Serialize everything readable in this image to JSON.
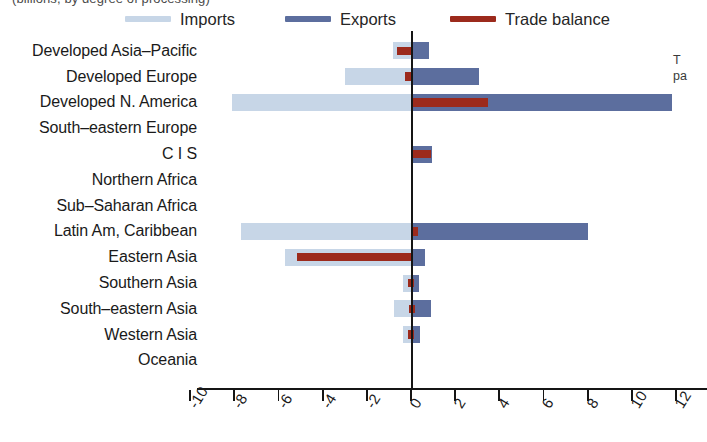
{
  "title_clipped": "(billions, by degree of processing)",
  "side_note_clipped": "T\npa",
  "legend": {
    "items": [
      {
        "label": "Imports",
        "color": "#c7d6e7",
        "name": "imports"
      },
      {
        "label": "Exports",
        "color": "#5c6e9e",
        "name": "exports"
      },
      {
        "label": "Trade balance",
        "color": "#9c2a1c",
        "name": "trade-balance"
      }
    ]
  },
  "axis": {
    "ticks": [
      "-10",
      "-8",
      "-6",
      "-4",
      "-2",
      "0",
      "2",
      "4",
      "6",
      "8",
      "10",
      "12"
    ],
    "min": -10,
    "max": 12,
    "step": 2
  },
  "chart_data": {
    "type": "bar",
    "orientation": "horizontal",
    "title": "(billions, by degree of processing)",
    "xlabel": "",
    "ylabel": "",
    "xlim": [
      -10,
      12
    ],
    "xticks": [
      -10,
      -8,
      -6,
      -4,
      -2,
      0,
      2,
      4,
      6,
      8,
      10,
      12
    ],
    "grid": false,
    "legend_position": "top",
    "categories": [
      "Developed Asia–Pacific",
      "Developed Europe",
      "Developed N. America",
      "South–eastern Europe",
      "C I S",
      "Northern Africa",
      "Sub–Saharan Africa",
      "Latin Am, Caribbean",
      "Eastern Asia",
      "Southern Asia",
      "South–eastern Asia",
      "Western Asia",
      "Oceania"
    ],
    "series": [
      {
        "name": "Imports",
        "color": "#c7d6e7",
        "values": [
          -0.8,
          -3.0,
          -8.1,
          0.0,
          0.0,
          0.0,
          0.0,
          -7.7,
          -5.7,
          -0.35,
          -0.75,
          -0.35,
          0.0
        ]
      },
      {
        "name": "Exports",
        "color": "#5c6e9e",
        "values": [
          0.8,
          3.1,
          11.8,
          0.0,
          0.95,
          0.0,
          0.0,
          8.0,
          0.65,
          0.35,
          0.9,
          0.4,
          0.0
        ]
      },
      {
        "name": "Trade balance",
        "color": "#9c2a1c",
        "values": [
          -0.6,
          -0.2,
          3.5,
          0.0,
          0.85,
          0.0,
          0.0,
          0.3,
          -5.1,
          0.1,
          0.15,
          0.1,
          0.0
        ]
      }
    ],
    "balance_spans": [
      {
        "from": -0.65,
        "to": 0.05
      },
      {
        "from": -0.25,
        "to": 0.0
      },
      {
        "from": 0.0,
        "to": 3.5
      },
      {
        "from": 0.0,
        "to": 0.0
      },
      {
        "from": 0.0,
        "to": 0.9
      },
      {
        "from": 0.0,
        "to": 0.0
      },
      {
        "from": 0.0,
        "to": 0.0
      },
      {
        "from": 0.0,
        "to": 0.3
      },
      {
        "from": -5.15,
        "to": 0.05
      },
      {
        "from": -0.12,
        "to": 0.12
      },
      {
        "from": -0.1,
        "to": 0.2
      },
      {
        "from": -0.12,
        "to": 0.12
      },
      {
        "from": 0.0,
        "to": 0.0
      }
    ]
  }
}
